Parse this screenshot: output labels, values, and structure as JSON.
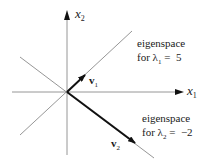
{
  "diagram": {
    "axes": {
      "x_label": "x",
      "x_sub": "1",
      "y_label": "x",
      "y_sub": "2"
    },
    "vectors": [
      {
        "name": "v",
        "sub": "1",
        "direction": [
          1,
          1
        ]
      },
      {
        "name": "v",
        "sub": "2",
        "direction": [
          1,
          -1
        ]
      }
    ],
    "eigenspaces": [
      {
        "line1": "eigenspace",
        "line2_prefix": "for λ",
        "line2_sub": "1",
        "line2_suffix": " =  5"
      },
      {
        "line1": "eigenspace",
        "line2_prefix": "for λ",
        "line2_sub": "2",
        "line2_suffix": " =  −2"
      }
    ],
    "colors": {
      "axis": "#8a8a8a",
      "vector": "#111111",
      "text": "#1a1a1a"
    }
  }
}
